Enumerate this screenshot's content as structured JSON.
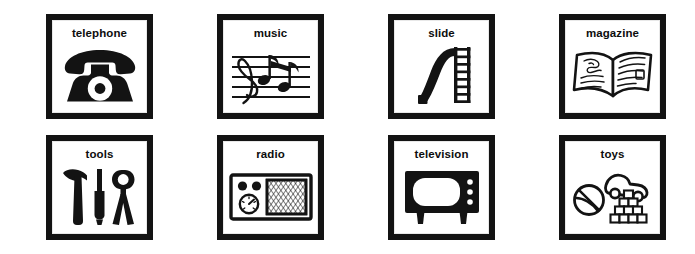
{
  "page": {
    "background_color": "#ffffff",
    "ink_color": "#131313",
    "columns": 4,
    "rows": 2
  },
  "cards": [
    {
      "label": "telephone",
      "icon": "rotary-telephone-icon",
      "row": 1,
      "column": 1
    },
    {
      "label": "music",
      "icon": "music-staff-notes-icon",
      "row": 1,
      "column": 2
    },
    {
      "label": "slide",
      "icon": "playground-slide-icon",
      "row": 1,
      "column": 3
    },
    {
      "label": "magazine",
      "icon": "open-magazine-icon",
      "row": 1,
      "column": 4
    },
    {
      "label": "tools",
      "icon": "hammer-screwdriver-pliers-icon",
      "row": 2,
      "column": 1
    },
    {
      "label": "radio",
      "icon": "table-radio-icon",
      "row": 2,
      "column": 2
    },
    {
      "label": "television",
      "icon": "television-set-icon",
      "row": 2,
      "column": 3
    },
    {
      "label": "toys",
      "icon": "ball-car-blocks-icon",
      "row": 2,
      "column": 4
    }
  ]
}
